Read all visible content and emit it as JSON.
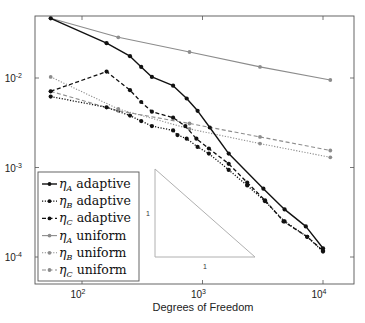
{
  "chart_data": {
    "type": "line",
    "title": "",
    "xlabel": "Degrees of Freedom",
    "ylabel": "",
    "xscale": "log",
    "yscale": "log",
    "xlim": [
      40,
      16000
    ],
    "ylim": [
      4.7e-05,
      0.06
    ],
    "x_ticks": [
      {
        "value": 100,
        "base": "10",
        "exp": "2"
      },
      {
        "value": 1000,
        "base": "10",
        "exp": "3"
      },
      {
        "value": 10000,
        "base": "10",
        "exp": "4"
      }
    ],
    "y_ticks": [
      {
        "value": 0.01,
        "base": "10",
        "exp": "-2"
      },
      {
        "value": 0.001,
        "base": "10",
        "exp": "-3"
      },
      {
        "value": 0.0001,
        "base": "10",
        "exp": "-4"
      }
    ],
    "grid": false,
    "legend_position": "lower-left",
    "slope_triangle": {
      "label_vertical": "1",
      "label_horizontal": "1",
      "color": "#b0b0b0"
    },
    "series": [
      {
        "name": "ηA adaptive",
        "eta_sub": "A",
        "kind": "adaptive",
        "color": "#111111",
        "dash": "solid",
        "width": 1.4,
        "x": [
          55,
          160,
          250,
          310,
          380,
          570,
          740,
          910,
          1150,
          1650,
          3200,
          4800,
          7200,
          10000
        ],
        "y": [
          0.0465,
          0.0245,
          0.0175,
          0.0133,
          0.0103,
          0.0082,
          0.0059,
          0.0043,
          0.0028,
          0.00143,
          0.00058,
          0.00034,
          0.00022,
          0.000125
        ]
      },
      {
        "name": "ηB adaptive",
        "eta_sub": "B",
        "kind": "adaptive",
        "color": "#111111",
        "dash": "dotted",
        "width": 1.3,
        "x": [
          55,
          160,
          250,
          310,
          380,
          570,
          620,
          740,
          910,
          1130,
          1650,
          2350,
          3300,
          4800,
          7400,
          10000
        ],
        "y": [
          0.0062,
          0.0047,
          0.0038,
          0.0033,
          0.0029,
          0.0026,
          0.0023,
          0.0021,
          0.0017,
          0.00143,
          0.00094,
          0.00063,
          0.00042,
          0.00025,
          0.000168,
          0.000115
        ]
      },
      {
        "name": "ηC adaptive",
        "eta_sub": "C",
        "kind": "adaptive",
        "color": "#111111",
        "dash": "dashed",
        "width": 1.3,
        "x": [
          55,
          160,
          250,
          310,
          380,
          570,
          720,
          890,
          1130,
          1650,
          2350,
          3300,
          4700,
          7400,
          10000
        ],
        "y": [
          0.0071,
          0.0118,
          0.0073,
          0.0054,
          0.0042,
          0.0036,
          0.0029,
          0.0021,
          0.00163,
          0.0011,
          0.00068,
          0.00043,
          0.00025,
          0.000168,
          0.000118
        ]
      },
      {
        "name": "ηA uniform",
        "eta_sub": "A",
        "kind": "uniform",
        "color": "#8c8c8c",
        "dash": "solid",
        "width": 1.1,
        "x": [
          55,
          200,
          780,
          3000,
          11500
        ],
        "y": [
          0.0465,
          0.0285,
          0.0195,
          0.0133,
          0.0095
        ]
      },
      {
        "name": "ηB uniform",
        "eta_sub": "B",
        "kind": "uniform",
        "color": "#8c8c8c",
        "dash": "dotted",
        "width": 1.1,
        "x": [
          55,
          200,
          780,
          3000,
          11500
        ],
        "y": [
          0.0103,
          0.0045,
          0.0027,
          0.00185,
          0.0013
        ]
      },
      {
        "name": "ηC uniform",
        "eta_sub": "C",
        "kind": "uniform",
        "color": "#8c8c8c",
        "dash": "dashed",
        "width": 1.1,
        "x": [
          55,
          200,
          780,
          3000,
          11500
        ],
        "y": [
          0.0071,
          0.0043,
          0.0031,
          0.0022,
          0.00155
        ]
      }
    ]
  },
  "legend": {
    "items": [
      {
        "eta": "η",
        "sub": "A",
        "label": "adaptive"
      },
      {
        "eta": "η",
        "sub": "B",
        "label": "adaptive"
      },
      {
        "eta": "η",
        "sub": "C",
        "label": "adaptive"
      },
      {
        "eta": "η",
        "sub": "A",
        "label": "uniform"
      },
      {
        "eta": "η",
        "sub": "B",
        "label": "uniform"
      },
      {
        "eta": "η",
        "sub": "C",
        "label": "uniform"
      }
    ]
  }
}
